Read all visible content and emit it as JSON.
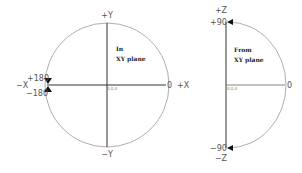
{
  "left_diagram": {
    "title_line1": "In",
    "title_line2": "XY plane",
    "axis_top": "+Y",
    "axis_bottom": "−Y",
    "axis_left": "−X",
    "axis_right": "+X",
    "origin": "0,0,0",
    "angle_zero": "0",
    "angle_plus": "+180",
    "angle_minus": "−180"
  },
  "right_diagram": {
    "title_line1": "From",
    "title_line2": "XY plane",
    "axis_top": "+Z",
    "axis_bottom": "−Z",
    "origin": "0,0,0",
    "angle_zero": "0",
    "angle_plus": "+90",
    "angle_minus": "−90"
  },
  "colors": {
    "axis": "#333333",
    "arc": "#888888",
    "arrow": "#111111"
  }
}
